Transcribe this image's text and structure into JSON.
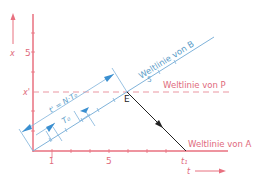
{
  "diagram": {
    "colors": {
      "axis": "#e8707f",
      "pink_text": "#e06a7c",
      "blue": "#4aa0d8",
      "blue_text": "#5a9cc8",
      "black": "#222222",
      "dashed": "#e88a96"
    },
    "axes": {
      "vertical_label": "x",
      "horizontal_label": "t",
      "vertical_tick_label": "5",
      "x_prime_label": "x'",
      "horizontal_tick_labels": [
        "1",
        "5"
      ],
      "t1_label": "t₁"
    },
    "worldlines": {
      "B": "Weltlinie von B",
      "P": "Weltlinie von P",
      "A": "Weltlinie von A"
    },
    "event_label": "E",
    "b_tick_label": "5",
    "dimensions": {
      "t_prime": "t' = N·T₀",
      "T0": "T₀"
    }
  }
}
